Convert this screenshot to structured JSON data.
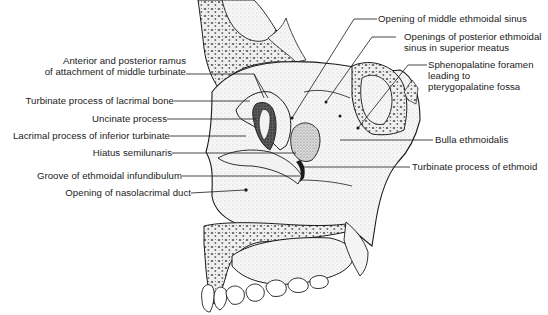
{
  "figure": {
    "colors": {
      "ink": "#1a1a1a",
      "bone_fill": "#ececec",
      "mucosa_fill": "#f6f6f6",
      "shadow_fill": "#444444",
      "background": "#ffffff"
    }
  },
  "labels": {
    "left": [
      {
        "id": "ant-post-ramus",
        "line1": "Anterior and posterior ramus",
        "line2": "of attachment of middle turbinate"
      },
      {
        "id": "turbinate-process-lacrimal",
        "text": "Turbinate process of lacrimal bone"
      },
      {
        "id": "uncinate-process",
        "text": "Uncinate process"
      },
      {
        "id": "lacrimal-process-inferior-turbinate",
        "text": "Lacrimal process of inferior turbinate"
      },
      {
        "id": "hiatus-semilunaris",
        "text": "Hiatus semilunaris"
      },
      {
        "id": "groove-ethmoidal-infundibulum",
        "text": "Groove of ethmoidal infundibulum"
      },
      {
        "id": "opening-nasolacrimal-duct",
        "text": "Opening of nasolacrimal duct"
      }
    ],
    "right": [
      {
        "id": "opening-middle-ethmoidal-sinus",
        "text": "Opening of middle ethmoidal sinus"
      },
      {
        "id": "openings-posterior-ethmoidal-sinus",
        "line1": "Openings of posterior ethmoidal",
        "line2": "sinus in superior meatus"
      },
      {
        "id": "sphenopalatine-foramen",
        "line1": "Sphenopalatine foramen",
        "line2": "leading to",
        "line3": "pterygopalatine fossa"
      },
      {
        "id": "bulla-ethmoidalis",
        "text": "Bulla ethmoidalis"
      },
      {
        "id": "turbinate-process-ethmoid",
        "text": "Turbinate process of ethmoid"
      }
    ]
  }
}
